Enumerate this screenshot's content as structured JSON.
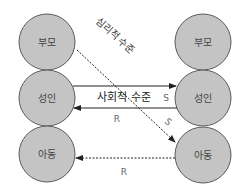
{
  "diagram": {
    "title": "",
    "colors": {
      "circle_fill": "#c4c4c4",
      "circle_stroke": "#5a5a5a",
      "line": "#222222",
      "label": "#555555",
      "text": "#333333"
    },
    "left_nodes": [
      {
        "id": "L-parent",
        "label": "부모"
      },
      {
        "id": "L-adult",
        "label": "성인"
      },
      {
        "id": "L-child",
        "label": "아동"
      }
    ],
    "right_nodes": [
      {
        "id": "R-parent",
        "label": "부모"
      },
      {
        "id": "R-adult",
        "label": "성인"
      },
      {
        "id": "R-child",
        "label": "아동"
      }
    ],
    "levels": {
      "social": "사회적 수준",
      "psychological": "심리적 수준"
    },
    "edges": [
      {
        "from": "L-adult",
        "to": "R-adult",
        "style": "solid",
        "label": "S"
      },
      {
        "from": "R-adult",
        "to": "L-adult",
        "style": "solid",
        "label": "R"
      },
      {
        "from": "L-parent",
        "to": "R-child",
        "style": "dotted",
        "label": "S"
      },
      {
        "from": "R-child",
        "to": "L-child",
        "style": "dotted",
        "label": "R"
      }
    ]
  }
}
